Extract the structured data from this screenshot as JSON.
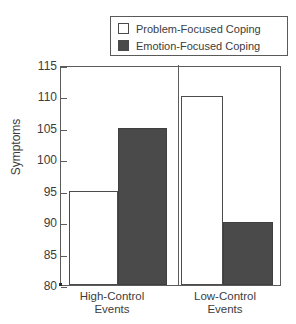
{
  "chart_data": {
    "type": "bar",
    "title": "",
    "subtitle": "",
    "xlabel": "",
    "ylabel": "Symptoms",
    "categories": [
      "High-Control Events",
      "Low-Control Events"
    ],
    "category_lines": [
      [
        "High-Control",
        "Events"
      ],
      [
        "Low-Control",
        "Events"
      ]
    ],
    "series": [
      {
        "name": "Problem-Focused Coping",
        "values": [
          95,
          110
        ],
        "color": "#ffffff",
        "swatch": "white-swatch"
      },
      {
        "name": "Emotion-Focused Coping",
        "values": [
          105,
          90
        ],
        "color": "#4a4a4a",
        "swatch": "dark-swatch"
      }
    ],
    "ylim": [
      80,
      115
    ],
    "yticks": [
      80,
      85,
      90,
      95,
      100,
      105,
      110,
      115
    ],
    "ytick_labels": [
      "80",
      "85",
      "90",
      "95",
      "100",
      "105",
      "110",
      "115"
    ],
    "grid": false,
    "legend_position": "top-right",
    "frame": "box"
  },
  "legend": {
    "entries": [
      {
        "label": "Problem-Focused Coping"
      },
      {
        "label": "Emotion-Focused Coping"
      }
    ]
  },
  "axes": {
    "y_title": "Symptoms",
    "tick_labels": [
      "115",
      "110",
      "105",
      "100",
      "95",
      "90",
      "85",
      "80"
    ]
  },
  "x_labels": {
    "group1_line1": "High-Control",
    "group1_line2": "Events",
    "group2_line1": "Low-Control",
    "group2_line2": "Events"
  }
}
